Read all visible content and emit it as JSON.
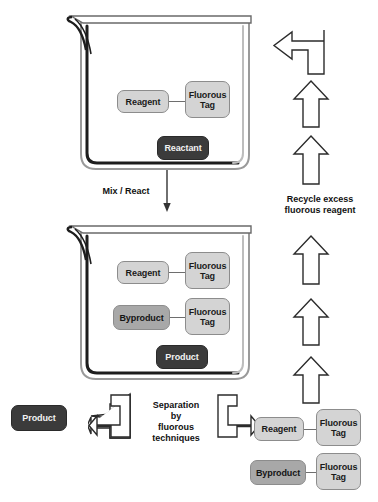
{
  "diagram": {
    "colors": {
      "light_box": "#d4d4d4",
      "mid_box": "#a8a8a8",
      "dark_box": "#3b3b3b",
      "outline": "#2b2b2b",
      "background": "#ffffff"
    }
  },
  "top_beaker": {
    "name": "reaction-beaker-initial",
    "boxes": {
      "reagent": "Reagent",
      "fluorous_tag": "Fluorous\nTag",
      "reactant": "Reactant"
    }
  },
  "mix_step": {
    "label": "Mix / React"
  },
  "bottom_beaker": {
    "name": "reaction-beaker-after",
    "boxes": {
      "reagent": "Reagent",
      "fluorous_tag_1": "Fluorous\nTag",
      "byproduct": "Byproduct",
      "fluorous_tag_2": "Fluorous\nTag",
      "product": "Product"
    }
  },
  "separation_step": {
    "label": "Separation\nby\nfluorous\ntechniques"
  },
  "outputs": {
    "product": "Product",
    "reagent": "Reagent",
    "reagent_tag": "Fluorous\nTag",
    "byproduct": "Byproduct",
    "byproduct_tag": "Fluorous\nTag"
  },
  "recycle": {
    "label": "Recycle excess\nfluorous reagent",
    "arrow_count_upper": 2,
    "arrow_count_lower": 3,
    "turn_arrow": "curved-left-arrow"
  }
}
